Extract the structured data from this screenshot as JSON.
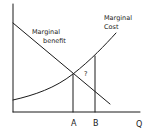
{
  "diagram": {
    "title": "",
    "curves": {
      "marginal_benefit": {
        "label_line1": "Marginal",
        "label_line2": "benefit"
      },
      "marginal_cost": {
        "label_line1": "Marginal",
        "label_line2": "Cost"
      }
    },
    "x_axis_label": "Q",
    "quantity_marks": {
      "a": "A",
      "b": "B"
    },
    "region_label": "?",
    "ink_color": "#1a1a1a",
    "background_color": "#ffffff"
  }
}
